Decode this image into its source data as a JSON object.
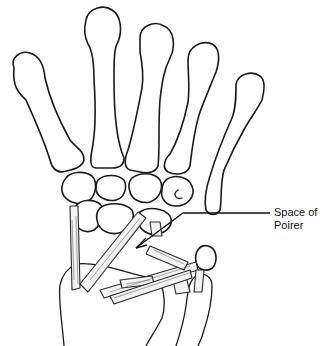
{
  "figure": {
    "annotations": [
      {
        "id": "space-of-poirer",
        "lines": [
          "Space of",
          "Poirer"
        ]
      }
    ],
    "colors": {
      "line": "#1a1a1a",
      "background": "#ffffff",
      "ligament_fill": "#f2f2f2"
    }
  }
}
